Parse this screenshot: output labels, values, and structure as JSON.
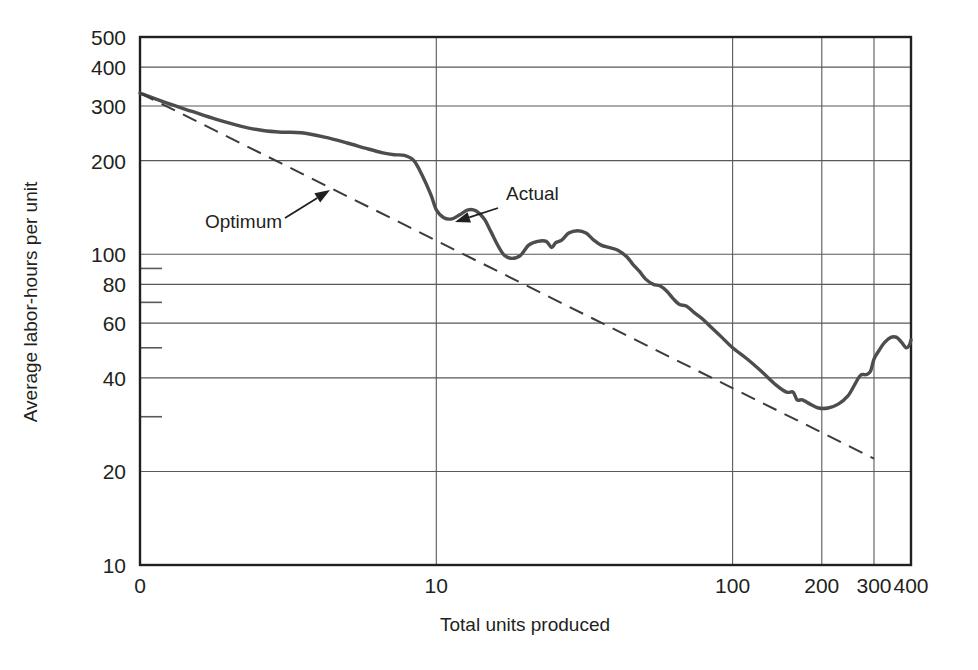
{
  "chart_data": {
    "type": "line",
    "title": "",
    "xlabel": "Total units produced",
    "ylabel": "Average labor-hours per unit",
    "xscale": "log",
    "yscale": "log",
    "xlim": [
      1,
      400
    ],
    "ylim": [
      10,
      500
    ],
    "grid": true,
    "legend": "inline-annotations",
    "x_ticks": [
      {
        "value": 1,
        "label": "0"
      },
      {
        "value": 10,
        "label": "10"
      },
      {
        "value": 100,
        "label": "100"
      },
      {
        "value": 200,
        "label": "200"
      },
      {
        "value": 300,
        "label": "300"
      },
      {
        "value": 400,
        "label": "400"
      }
    ],
    "y_ticks": [
      {
        "value": 500,
        "label": "500"
      },
      {
        "value": 400,
        "label": "400"
      },
      {
        "value": 300,
        "label": "300"
      },
      {
        "value": 200,
        "label": "200"
      },
      {
        "value": 100,
        "label": "100"
      },
      {
        "value": 80,
        "label": "80"
      },
      {
        "value": 60,
        "label": "60"
      },
      {
        "value": 40,
        "label": "40"
      },
      {
        "value": 20,
        "label": "20"
      },
      {
        "value": 10,
        "label": "10"
      }
    ],
    "y_minor_ticks": [
      90,
      70,
      50,
      30
    ],
    "series": [
      {
        "name": "Actual",
        "style": "solid",
        "color": "#4d4d4f",
        "points": [
          [
            1.0,
            330
          ],
          [
            1.25,
            305
          ],
          [
            1.5,
            288
          ],
          [
            1.8,
            272
          ],
          [
            2.2,
            258
          ],
          [
            2.6,
            250
          ],
          [
            3.0,
            247
          ],
          [
            3.5,
            246
          ],
          [
            4.2,
            238
          ],
          [
            5.0,
            228
          ],
          [
            5.8,
            219
          ],
          [
            6.6,
            212
          ],
          [
            7.2,
            209
          ],
          [
            7.8,
            208
          ],
          [
            8.4,
            200
          ],
          [
            9.0,
            178
          ],
          [
            9.6,
            155
          ],
          [
            10.0,
            139
          ],
          [
            10.6,
            131
          ],
          [
            11.3,
            130
          ],
          [
            12.0,
            134
          ],
          [
            12.8,
            139
          ],
          [
            13.6,
            138
          ],
          [
            14.5,
            130
          ],
          [
            15.3,
            118
          ],
          [
            16.2,
            106
          ],
          [
            17.0,
            99
          ],
          [
            18.0,
            97
          ],
          [
            19.2,
            99
          ],
          [
            20.5,
            107
          ],
          [
            22.0,
            110
          ],
          [
            23.5,
            110
          ],
          [
            24.5,
            105
          ],
          [
            25.3,
            109
          ],
          [
            26.5,
            111
          ],
          [
            28.0,
            117
          ],
          [
            30.0,
            119
          ],
          [
            32.0,
            117
          ],
          [
            34.0,
            111
          ],
          [
            36.0,
            107
          ],
          [
            38.5,
            105
          ],
          [
            41.0,
            103
          ],
          [
            44.0,
            98
          ],
          [
            46.0,
            93
          ],
          [
            48.5,
            88
          ],
          [
            51.0,
            83
          ],
          [
            54.0,
            80
          ],
          [
            57.0,
            79
          ],
          [
            60.0,
            76
          ],
          [
            63.0,
            72
          ],
          [
            66.0,
            69
          ],
          [
            70.0,
            68
          ],
          [
            74.0,
            65
          ],
          [
            79.0,
            62
          ],
          [
            85.0,
            58
          ],
          [
            92.0,
            54
          ],
          [
            100.0,
            50
          ],
          [
            112.0,
            46
          ],
          [
            125.0,
            42
          ],
          [
            140.0,
            38
          ],
          [
            152.0,
            36
          ],
          [
            160.0,
            36
          ],
          [
            165.0,
            34
          ],
          [
            172.0,
            34
          ],
          [
            182.0,
            33
          ],
          [
            195.0,
            32
          ],
          [
            210.0,
            32
          ],
          [
            228.0,
            33
          ],
          [
            245.0,
            35
          ],
          [
            258.0,
            38
          ],
          [
            266.0,
            40
          ],
          [
            272.0,
            41
          ],
          [
            276.0,
            41
          ],
          [
            283.0,
            41
          ],
          [
            292.0,
            42
          ],
          [
            300.0,
            46
          ],
          [
            312.0,
            49
          ],
          [
            326.0,
            52
          ],
          [
            342.0,
            54
          ],
          [
            358.0,
            54
          ],
          [
            372.0,
            52
          ],
          [
            385.0,
            50
          ],
          [
            395.0,
            51
          ],
          [
            400.0,
            53
          ]
        ]
      },
      {
        "name": "Optimum",
        "style": "dashed",
        "color": "#3b3b3d",
        "points": [
          [
            1.0,
            330
          ],
          [
            300.0,
            22
          ]
        ]
      }
    ],
    "annotations": [
      {
        "id": "optimum-annotation",
        "text": "Optimum",
        "text_x": 205,
        "text_y": 228,
        "arrow_from_x": 285,
        "arrow_from_y": 218,
        "arrow_to_x": 330,
        "arrow_to_y": 190
      },
      {
        "id": "actual-annotation",
        "text": "Actual",
        "text_x": 506,
        "text_y": 200,
        "arrow_from_x": 498,
        "arrow_from_y": 208,
        "arrow_to_x": 455,
        "arrow_to_y": 222
      }
    ]
  }
}
